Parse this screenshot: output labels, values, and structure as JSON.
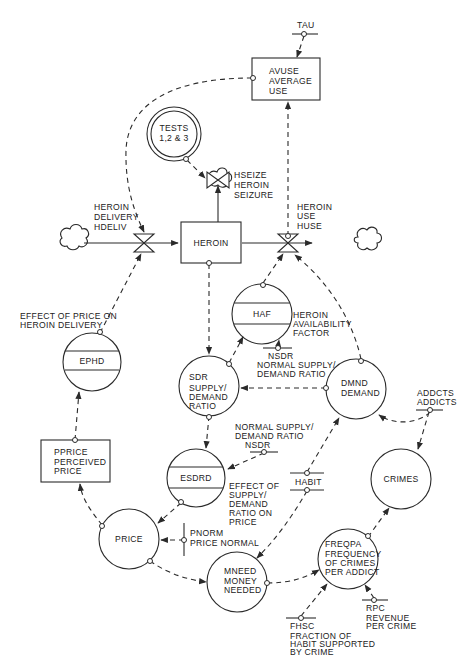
{
  "diagram": {
    "type": "system-dynamics-flow-diagram",
    "stocks": {
      "heroin": {
        "label": "HEROIN"
      },
      "avuse": {
        "line1": "AVUSE",
        "line2": "AVERAGE",
        "line3": "USE"
      },
      "pprice": {
        "line1": "PPRICE",
        "line2": "PERCEIVED",
        "line3": "PRICE"
      }
    },
    "tests": {
      "line1": "TESTS",
      "line2": "1,2 & 3"
    },
    "rates": {
      "hdeliv": {
        "line1": "HEROIN",
        "line2": "DELIVERY",
        "line3": "HDELIV"
      },
      "hseize": {
        "line1": "HSEIZE",
        "line2": "HEROIN",
        "line3": "SEIZURE"
      },
      "huse": {
        "line1": "HEROIN",
        "line2": "USE",
        "line3": "HUSE"
      }
    },
    "table_functions": {
      "haf": {
        "label": "HAF",
        "desc1": "HEROIN",
        "desc2": "AVAILABILITY",
        "desc3": "FACTOR"
      },
      "ephd": {
        "label": "EPHD",
        "desc1": "EFFECT OF PRICE ON",
        "desc2": "HEROIN DELIVERY"
      },
      "esdrd": {
        "label": "ESDRD",
        "desc1": "EFFECT OF",
        "desc2": "SUPPLY/",
        "desc3": "DEMAND",
        "desc4": "RATIO ON",
        "desc5": "PRICE"
      }
    },
    "auxiliaries": {
      "sdr": {
        "line1": "SDR",
        "line2": "SUPPLY/",
        "line3": "DEMAND",
        "line4": "RATIO"
      },
      "dmnd": {
        "line1": "DMND",
        "line2": "DEMAND"
      },
      "crimes": {
        "label": "CRIMES"
      },
      "price": {
        "label": "PRICE"
      },
      "mneed": {
        "line1": "MNEED",
        "line2": "MONEY",
        "line3": "NEEDED"
      },
      "freqpa": {
        "line1": "FREQPA",
        "line2": "FREQUENCY",
        "line3": "OF CRIMES",
        "line4": "PER ADDICT"
      }
    },
    "constants": {
      "tau": {
        "label": "TAU"
      },
      "nsdr1": {
        "line1": "NSDR",
        "line2": "NORMAL SUPPLY/",
        "line3": "DEMAND RATIO"
      },
      "nsdr2": {
        "line1": "NORMAL SUPPLY/",
        "line2": "DEMAND RATIO",
        "line3": "NSDR"
      },
      "addcts": {
        "line1": "ADDCTS",
        "line2": "ADDICTS"
      },
      "habit": {
        "label": "HABIT"
      },
      "pnorm": {
        "line1": "PNORM",
        "line2": "PRICE NORMAL"
      },
      "rpc": {
        "line1": "RPC",
        "line2": "REVENUE",
        "line3": "PER CRIME"
      },
      "fhsc": {
        "line1": "FHSC",
        "line2": "FRACTION OF",
        "line3": "HABIT SUPPORTED",
        "line4": "BY CRIME"
      }
    }
  }
}
